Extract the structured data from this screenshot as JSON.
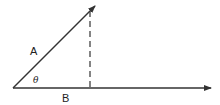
{
  "diagram": {
    "title": "",
    "vectors": [
      {
        "id": "A",
        "label": "A",
        "from": [
          13,
          88
        ],
        "to": [
          95,
          6
        ],
        "style": "solid",
        "arrow": true
      },
      {
        "id": "B",
        "label": "B",
        "from": [
          13,
          88
        ],
        "to": [
          211,
          88
        ],
        "style": "solid",
        "arrow": true
      }
    ],
    "projection": {
      "from": [
        90,
        11
      ],
      "to": [
        90,
        88
      ],
      "style": "dashed"
    },
    "angle": {
      "label": "θ",
      "between": [
        "A",
        "B"
      ]
    },
    "labels": {
      "a": "A",
      "b": "B",
      "theta": "θ"
    },
    "colors": {
      "line": "#333333",
      "background": "#ffffff"
    }
  }
}
